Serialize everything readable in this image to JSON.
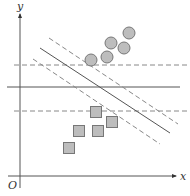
{
  "diagram": {
    "type": "svm-margin-illustration",
    "axes": {
      "x_label": "x",
      "y_label": "y",
      "origin_label": "O",
      "color": "#555555"
    },
    "lines": {
      "horizontal_solid": {
        "y": 87,
        "x1": 7,
        "x2": 180
      },
      "horizontal_dashed": [
        {
          "y": 65,
          "x1": 14,
          "x2": 190
        },
        {
          "y": 111,
          "x1": 14,
          "x2": 190
        }
      ],
      "diagonal_solid": {
        "x1": 40,
        "y1": 48,
        "x2": 170,
        "y2": 133
      },
      "diagonal_dashed": [
        {
          "x1": 49,
          "y1": 38,
          "x2": 178,
          "y2": 124
        },
        {
          "x1": 33,
          "y1": 59,
          "x2": 160,
          "y2": 144
        }
      ],
      "line_color": "#555555",
      "dash_color": "#888888"
    },
    "circles": {
      "fill": "#bdbdbd",
      "stroke": "#777777",
      "r": 6,
      "points": [
        {
          "cx": 91,
          "cy": 60
        },
        {
          "cx": 107,
          "cy": 57
        },
        {
          "cx": 111,
          "cy": 43
        },
        {
          "cx": 124,
          "cy": 48
        },
        {
          "cx": 129,
          "cy": 33
        }
      ]
    },
    "squares": {
      "fill": "#bdbdbd",
      "stroke": "#777777",
      "size": 11,
      "points": [
        {
          "cx": 96,
          "cy": 112
        },
        {
          "cx": 112,
          "cy": 122
        },
        {
          "cx": 79,
          "cy": 131
        },
        {
          "cx": 98,
          "cy": 131
        },
        {
          "cx": 69,
          "cy": 148
        }
      ]
    }
  }
}
